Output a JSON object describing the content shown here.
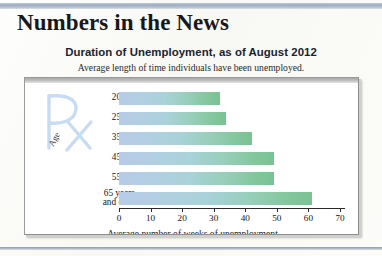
{
  "masthead": {
    "title": "Numbers in the News"
  },
  "chart_panel": {
    "title": "Duration of Unemployment, as of August 2012",
    "subtitle": "Average length of time individuals have been unemployed.",
    "watermark": "Rx",
    "y_axis_label": "Age"
  },
  "chart_data": {
    "type": "bar",
    "orientation": "horizontal",
    "title": "Duration of Unemployment, as of August 2012",
    "subtitle": "Average length of time individuals have been unemployed.",
    "categories": [
      "20–24",
      "25–34",
      "35–44",
      "45–54",
      "55–64",
      "65 years\nand over"
    ],
    "category_lines": [
      [
        "20–24"
      ],
      [
        "25–34"
      ],
      [
        "35–44"
      ],
      [
        "45–54"
      ],
      [
        "55–64"
      ],
      [
        "65 years",
        "and over"
      ]
    ],
    "values": [
      32,
      34,
      42,
      49,
      49,
      61
    ],
    "xlabel": "Average number of weeks of unemployment",
    "ylabel": "Age",
    "xlim": [
      0,
      70
    ],
    "xticks": [
      0,
      10,
      20,
      30,
      40,
      50,
      60,
      70
    ],
    "grid": false,
    "legend": false,
    "bar_gradient_start": "#b7cbe6",
    "bar_gradient_end": "#79c292"
  },
  "colors": {
    "accent_rule": "#95a6bd",
    "watermark": "#c9dcf0",
    "panel_background": "#ffffff",
    "axis": "#2a2a2a"
  }
}
